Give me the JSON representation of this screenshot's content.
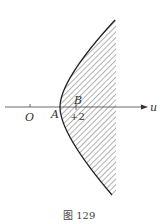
{
  "figure": {
    "caption": "图 129",
    "axis_label": "u",
    "origin_label": "O",
    "point_a_label": "A",
    "point_b_label": "B",
    "tick_value_label": "+2",
    "colors": {
      "curve": "#222222",
      "hatch": "#555555",
      "axis": "#444444"
    }
  }
}
